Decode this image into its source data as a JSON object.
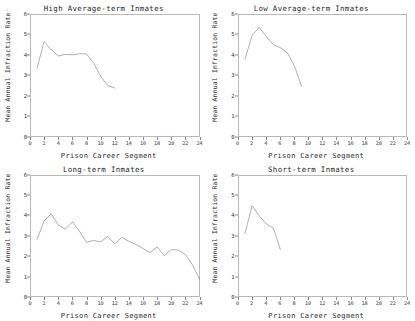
{
  "figure": {
    "background": "#ffffff",
    "line_color": "#6e6e6e",
    "frame_color": "#b9b9b9",
    "panel_count": 4
  },
  "chart_data": [
    {
      "type": "line",
      "title": "High Average-term Inmates",
      "xlabel": "Prison Career Segment",
      "ylabel": "Mean Annual Infraction Rate",
      "xlim": [
        0,
        24
      ],
      "ylim": [
        0,
        6
      ],
      "xticks": [
        0,
        2,
        4,
        6,
        8,
        10,
        12,
        14,
        16,
        18,
        20,
        22,
        24
      ],
      "yticks": [
        0,
        1,
        2,
        3,
        4,
        5,
        6
      ],
      "grid": false,
      "legend": "none",
      "x": [
        1,
        2,
        3,
        4,
        5,
        6,
        7,
        8,
        9,
        10,
        11,
        12
      ],
      "values": [
        3.35,
        4.65,
        4.25,
        3.95,
        4.02,
        4.0,
        4.05,
        4.05,
        3.6,
        2.95,
        2.5,
        2.38
      ]
    },
    {
      "type": "line",
      "title": "Low Average-term Inmates",
      "xlabel": "Prison Career Segment",
      "ylabel": "Mean Annual Infraction Rate",
      "xlim": [
        0,
        24
      ],
      "ylim": [
        0,
        6
      ],
      "xticks": [
        0,
        2,
        4,
        6,
        8,
        10,
        12,
        14,
        16,
        18,
        20,
        22,
        24
      ],
      "yticks": [
        0,
        1,
        2,
        3,
        4,
        5,
        6
      ],
      "grid": false,
      "legend": "none",
      "x": [
        1,
        2,
        3,
        4,
        5,
        6,
        7,
        8,
        9
      ],
      "values": [
        3.8,
        4.95,
        5.35,
        4.9,
        4.5,
        4.35,
        4.1,
        3.45,
        2.45
      ]
    },
    {
      "type": "line",
      "title": "Long-term Inmates",
      "xlabel": "Prison Career Segment",
      "ylabel": "Mean Annual Infraction Rate",
      "xlim": [
        0,
        24
      ],
      "ylim": [
        0,
        6
      ],
      "xticks": [
        0,
        2,
        4,
        6,
        8,
        10,
        12,
        14,
        16,
        18,
        20,
        22,
        24
      ],
      "yticks": [
        0,
        1,
        2,
        3,
        4,
        5,
        6
      ],
      "grid": false,
      "legend": "none",
      "x": [
        1,
        2,
        3,
        4,
        5,
        6,
        7,
        8,
        9,
        10,
        11,
        12,
        13,
        14,
        15,
        16,
        17,
        18,
        19,
        20,
        21,
        22,
        23,
        24
      ],
      "values": [
        2.85,
        3.75,
        4.1,
        3.55,
        3.35,
        3.7,
        3.25,
        2.7,
        2.8,
        2.72,
        3.0,
        2.62,
        2.95,
        2.75,
        2.6,
        2.4,
        2.2,
        2.48,
        2.05,
        2.35,
        2.32,
        2.1,
        1.6,
        0.9
      ]
    },
    {
      "type": "line",
      "title": "Short-term Inmates",
      "xlabel": "Prison Career Segment",
      "ylabel": "Mean Annual Infraction Rate",
      "xlim": [
        0,
        24
      ],
      "ylim": [
        0,
        6
      ],
      "xticks": [
        0,
        2,
        4,
        6,
        8,
        10,
        12,
        14,
        16,
        18,
        20,
        22,
        24
      ],
      "yticks": [
        0,
        1,
        2,
        3,
        4,
        5,
        6
      ],
      "grid": false,
      "legend": "none",
      "x": [
        1,
        2,
        3,
        4,
        5,
        6
      ],
      "values": [
        3.15,
        4.5,
        4.0,
        3.6,
        3.4,
        2.35
      ]
    }
  ]
}
